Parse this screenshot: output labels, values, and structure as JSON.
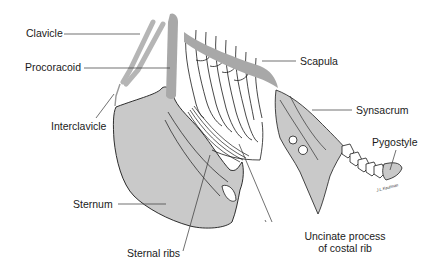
{
  "diagram": {
    "colors": {
      "bone_fill": "#c9c9c9",
      "highlight_bone": "#a8a8a8",
      "outline": "#1a1a1a",
      "leader_line": "#333333",
      "background": "#ffffff"
    },
    "labels": {
      "clavicle": "Clavicle",
      "procoracoid": "Procoracoid",
      "interclavicle": "Interclavicle",
      "scapula": "Scapula",
      "synsacrum": "Synsacrum",
      "pygostyle": "Pygostyle",
      "sternum": "Sternum",
      "sternal_ribs": "Sternal ribs",
      "uncinate_line1": "Uncinate process",
      "uncinate_line2": "of costal rib"
    },
    "signature": "J.L.Kaufman"
  }
}
